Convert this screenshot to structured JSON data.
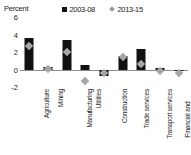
{
  "axis_unit_label": "Percent",
  "legend": [
    {
      "label": "2003-08",
      "marker": "bar-swatch-icon",
      "color": "#111111"
    },
    {
      "label": "2013-15",
      "marker": "diamond-marker-icon",
      "color": "#a6a6a6"
    }
  ],
  "chart_data": {
    "type": "bar",
    "title": "",
    "subtitle": "",
    "xlabel": "",
    "ylabel": "Percent",
    "ylim": [
      -2,
      6
    ],
    "yticks": [
      6,
      4,
      2,
      0,
      -2
    ],
    "ytick_labels": [
      "6",
      "4",
      "2",
      "0",
      "-2"
    ],
    "grid": false,
    "legend_position": "top",
    "categories": [
      "Agriculture",
      "Mining",
      "Manufacturing",
      "Utilities",
      "Construction",
      "Trade services",
      "Transport services",
      "Financial and Business services",
      "Government and Personal services"
    ],
    "category_lines": [
      [
        "Agriculture"
      ],
      [
        "Mining"
      ],
      [
        "Manufacturing"
      ],
      [
        "Utilities"
      ],
      [
        "Construction"
      ],
      [
        "Trade services"
      ],
      [
        "Transport services"
      ],
      [
        "Financial and",
        "Business services"
      ],
      [
        "Government and",
        "Personal services"
      ]
    ],
    "series": [
      {
        "name": "2003-08",
        "type": "bar",
        "color": "#111111",
        "values": [
          3.6,
          0.3,
          3.4,
          0.5,
          -0.7,
          1.6,
          2.4,
          0.2,
          0.0
        ]
      },
      {
        "name": "2013-15",
        "type": "marker",
        "color": "#a6a6a6",
        "values": [
          3.0,
          0.4,
          2.3,
          -1.0,
          -0.1,
          1.8,
          1.0,
          0.2,
          0.0
        ]
      }
    ]
  }
}
